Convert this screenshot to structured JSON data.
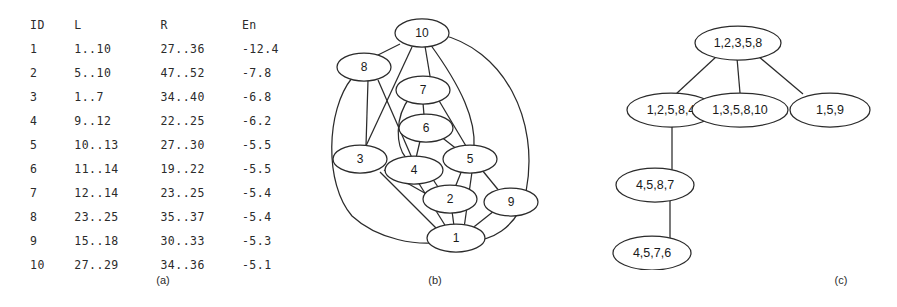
{
  "figure": {
    "panels": [
      {
        "id": "a",
        "caption": "(a)"
      },
      {
        "id": "b",
        "caption": "(b)"
      },
      {
        "id": "c",
        "caption": "(c)"
      }
    ]
  },
  "table": {
    "headers": [
      "ID",
      "L",
      "R",
      "En"
    ],
    "rows": [
      {
        "id": "1",
        "l": "1..10",
        "r": "27..36",
        "en": "-12.4"
      },
      {
        "id": "2",
        "l": "5..10",
        "r": "47..52",
        "en": "-7.8"
      },
      {
        "id": "3",
        "l": "1..7",
        "r": "34..40",
        "en": "-6.8"
      },
      {
        "id": "4",
        "l": "9..12",
        "r": "22..25",
        "en": "-6.2"
      },
      {
        "id": "5",
        "l": "10..13",
        "r": "27..30",
        "en": "-5.5"
      },
      {
        "id": "6",
        "l": "11..14",
        "r": "19..22",
        "en": "-5.5"
      },
      {
        "id": "7",
        "l": "12..14",
        "r": "23..25",
        "en": "-5.4"
      },
      {
        "id": "8",
        "l": "23..25",
        "r": "35..37",
        "en": "-5.4"
      },
      {
        "id": "9",
        "l": "15..18",
        "r": "30..33",
        "en": "-5.3"
      },
      {
        "id": "10",
        "l": "27..29",
        "r": "34..36",
        "en": "-5.1"
      }
    ]
  },
  "graph": {
    "nodes": [
      {
        "key": "n10",
        "label": "10"
      },
      {
        "key": "n8",
        "label": "8"
      },
      {
        "key": "n7",
        "label": "7"
      },
      {
        "key": "n6",
        "label": "6"
      },
      {
        "key": "n3",
        "label": "3"
      },
      {
        "key": "n4",
        "label": "4"
      },
      {
        "key": "n5",
        "label": "5"
      },
      {
        "key": "n2",
        "label": "2"
      },
      {
        "key": "n9",
        "label": "9"
      },
      {
        "key": "n1",
        "label": "1"
      }
    ],
    "edges": [
      [
        "10",
        "8"
      ],
      [
        "10",
        "7"
      ],
      [
        "10",
        "5"
      ],
      [
        "10",
        "1"
      ],
      [
        "10",
        "3"
      ],
      [
        "8",
        "3"
      ],
      [
        "8",
        "4"
      ],
      [
        "8",
        "1"
      ],
      [
        "7",
        "6"
      ],
      [
        "7",
        "5"
      ],
      [
        "7",
        "4"
      ],
      [
        "6",
        "4"
      ],
      [
        "6",
        "5"
      ],
      [
        "3",
        "4"
      ],
      [
        "3",
        "1"
      ],
      [
        "3",
        "2"
      ],
      [
        "4",
        "2"
      ],
      [
        "4",
        "1"
      ],
      [
        "5",
        "2"
      ],
      [
        "5",
        "1"
      ],
      [
        "5",
        "9"
      ],
      [
        "2",
        "1"
      ],
      [
        "9",
        "1"
      ]
    ]
  },
  "tree": {
    "nodes": [
      {
        "key": "root",
        "label": "1,2,3,5,8"
      },
      {
        "key": "c1",
        "label": "1,2,5,8,4"
      },
      {
        "key": "c2",
        "label": "1,3,5,8,10"
      },
      {
        "key": "c3",
        "label": "1,5,9"
      },
      {
        "key": "g1",
        "label": "4,5,8,7"
      },
      {
        "key": "g2",
        "label": "4,5,7,6"
      }
    ],
    "edges": [
      [
        "root",
        "c1"
      ],
      [
        "root",
        "c2"
      ],
      [
        "root",
        "c3"
      ],
      [
        "c1",
        "g1"
      ],
      [
        "g1",
        "g2"
      ]
    ]
  }
}
